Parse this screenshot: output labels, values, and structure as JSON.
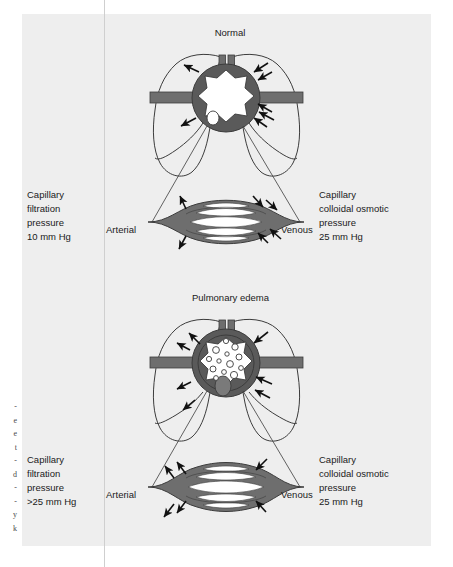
{
  "figure": {
    "background_color": "#eeeeee",
    "page_color": "#ffffff",
    "vessel_color": "#6e6e6e",
    "heart_ring_color": "#5a5a5a",
    "lumen_color": "#ffffff",
    "outline_color": "#3c3c3c",
    "arrow_color": "#111111",
    "text_color": "#1a1a1a"
  },
  "margin_fragments": [
    "-",
    "e",
    "e",
    "t",
    "-",
    "d",
    "-",
    "-",
    "y",
    "k"
  ],
  "panels": [
    {
      "id": "normal",
      "title": "Normal",
      "left_text": {
        "line1": "Capillary",
        "line2": "filtration",
        "line3": "pressure",
        "line4": "10 mm Hg"
      },
      "right_text": {
        "line1": "Capillary",
        "line2": "colloidal osmotic",
        "line3": "pressure",
        "line4": "25 mm Hg"
      },
      "arterial_label": "Arterial",
      "venous_label": "Venous",
      "alveolar_fluid": false
    },
    {
      "id": "pulmonary-edema",
      "title": "Pulmonary edema",
      "left_text": {
        "line1": "Capillary",
        "line2": "filtration",
        "line3": "pressure",
        "line4": ">25 mm Hg"
      },
      "right_text": {
        "line1": "Capillary",
        "line2": "colloidal osmotic",
        "line3": "pressure",
        "line4": "25 mm Hg"
      },
      "arterial_label": "Arterial",
      "venous_label": "Venous",
      "alveolar_fluid": true
    }
  ]
}
